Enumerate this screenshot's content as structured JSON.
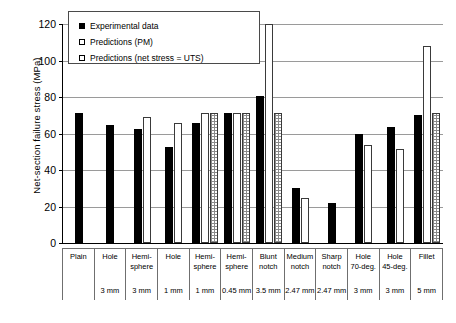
{
  "chart_data": {
    "type": "bar",
    "title": "",
    "xlabel": "",
    "ylabel": "Net-section failure stress (MPa)",
    "ylim": [
      0,
      120
    ],
    "ytick_values": [
      0,
      20,
      40,
      60,
      80,
      100,
      120
    ],
    "ytick_labels": [
      "0",
      "20",
      "40",
      "60",
      "80",
      "100",
      "120"
    ],
    "grid": true,
    "legend_position": "top-left inside",
    "categories": [
      "Plain",
      "Hole 3 mm",
      "Hemi-sphere 3 mm",
      "Hole 1 mm",
      "Hemi-sphere 1 mm",
      "Hemi-sphere 0.45 mm",
      "Blunt notch 3.5 mm",
      "Medium notch 2.47 mm",
      "Sharp notch 2.47 mm",
      "Hole 70-deg. 3 mm",
      "Hole 45-deg. 3 mm",
      "Fillet 5 mm"
    ],
    "series": [
      {
        "name": "Experimental data",
        "color": "#000000",
        "values": [
          71.5,
          64.5,
          62.7,
          52.5,
          66.0,
          71.5,
          80.5,
          30.0,
          22.0,
          59.5,
          63.5,
          70.0
        ]
      },
      {
        "name": "Predictions (PM)",
        "color": "#ffffff",
        "values": [
          null,
          null,
          69.3,
          65.5,
          71.5,
          71.5,
          121.0,
          24.5,
          null,
          53.5,
          51.5,
          108.0
        ]
      },
      {
        "name": "Predictions (net stress = UTS)",
        "color": "#ffffff",
        "values": [
          null,
          null,
          null,
          null,
          71.5,
          71.5,
          71.5,
          null,
          null,
          null,
          null,
          71.5
        ]
      }
    ]
  },
  "legend": {
    "items": [
      {
        "label": "Experimental data",
        "swatch": "filled-black-square"
      },
      {
        "label": "Predictions (PM)",
        "swatch": "open-square"
      },
      {
        "label": "Predictions (net stress = UTS)",
        "swatch": "dotted-square"
      }
    ]
  },
  "axis": {
    "y_title": "Net-section failure stress (MPa)",
    "ticks": [
      {
        "label": "120",
        "value": 120
      },
      {
        "label": "100",
        "value": 100
      },
      {
        "label": "80",
        "value": 80
      },
      {
        "label": "60",
        "value": 60
      },
      {
        "label": "40",
        "value": 40
      },
      {
        "label": "20",
        "value": 20
      },
      {
        "label": "0",
        "value": 0
      }
    ]
  },
  "xtable": {
    "columns": [
      {
        "line1": "Plain",
        "line2": "",
        "line3": ""
      },
      {
        "line1": "Hole",
        "line2": "",
        "line3": "3 mm"
      },
      {
        "line1": "Hemi-",
        "line2": "sphere",
        "line3": "3 mm"
      },
      {
        "line1": "Hole",
        "line2": "",
        "line3": "1 mm"
      },
      {
        "line1": "Hemi-",
        "line2": "sphere",
        "line3": "1 mm"
      },
      {
        "line1": "Hemi-",
        "line2": "sphere",
        "line3": "0.45 mm"
      },
      {
        "line1": "Blunt",
        "line2": "notch",
        "line3": "3.5 mm"
      },
      {
        "line1": "Medium",
        "line2": "notch",
        "line3": "2.47 mm"
      },
      {
        "line1": "Sharp",
        "line2": "notch",
        "line3": "2.47 mm"
      },
      {
        "line1": "Hole",
        "line2": "70-deg.",
        "line3": "3 mm"
      },
      {
        "line1": "Hole",
        "line2": "45-deg.",
        "line3": "3 mm"
      },
      {
        "line1": "Fillet",
        "line2": "",
        "line3": "5 mm"
      }
    ]
  }
}
